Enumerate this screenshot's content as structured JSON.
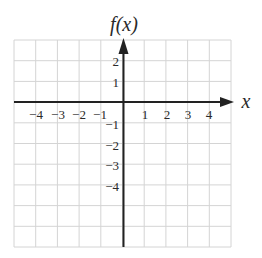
{
  "title": "f(x)",
  "x_axis_label": "x",
  "x_tick_labels": [
    "-4",
    "-3",
    "-2",
    "-1",
    "1",
    "2",
    "3",
    "4"
  ],
  "y_tick_labels": [
    "2",
    "1",
    "-1",
    "-2",
    "-3",
    "-4"
  ],
  "grid": {
    "columns": 10,
    "rows": 10,
    "x_range": [
      -5,
      5
    ],
    "y_range": [
      -7,
      3
    ]
  },
  "colors": {
    "grid": "#d4d4d4",
    "axis": "#222222",
    "text": "#2a2a2a"
  }
}
